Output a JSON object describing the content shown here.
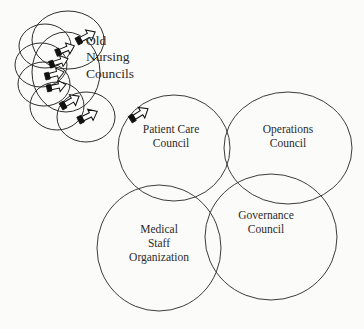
{
  "diagram": {
    "background_color": "#fbfbf9",
    "stroke_color": "#3c3c3c",
    "text_color": "#2b2b2b",
    "nodes": [
      {
        "id": "old-nursing-councils",
        "label": "Old\nNursing\nCouncils",
        "shape": "circle-cluster",
        "count": 6
      },
      {
        "id": "patient-care-council",
        "label": "Patient Care\nCouncil",
        "shape": "ellipse"
      },
      {
        "id": "operations-council",
        "label": "Operations\nCouncil",
        "shape": "ellipse"
      },
      {
        "id": "medical-staff-organization",
        "label": "Medical\nStaff\nOrganization",
        "shape": "ellipse"
      },
      {
        "id": "governance-council",
        "label": "Governance\nCouncil",
        "shape": "ellipse"
      }
    ],
    "arrows": [
      {
        "id": "arrow-1",
        "direction": "up-right"
      },
      {
        "id": "arrow-2",
        "direction": "up-right"
      },
      {
        "id": "arrow-3",
        "direction": "up-right"
      },
      {
        "id": "arrow-4",
        "direction": "up-right"
      },
      {
        "id": "arrow-5",
        "direction": "up-right"
      },
      {
        "id": "arrow-6",
        "direction": "up-right"
      },
      {
        "id": "arrow-7",
        "direction": "up-right"
      }
    ]
  }
}
